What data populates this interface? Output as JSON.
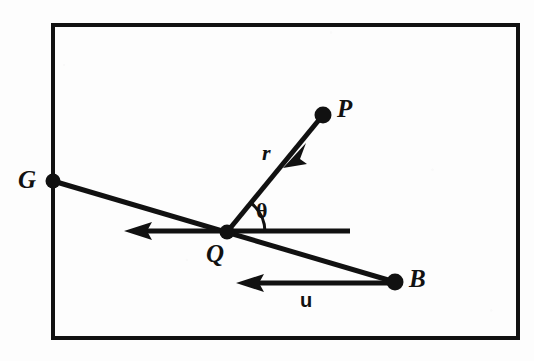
{
  "figure": {
    "kind": "geometry-vector-diagram",
    "background_color": "#fdfdfd",
    "ink_color": "#111111",
    "frame": {
      "x": 53,
      "y": 25,
      "width": 465,
      "height": 313,
      "stroke_width": 4
    },
    "points": [
      {
        "id": "G",
        "label": "G",
        "x": 53,
        "y": 181,
        "label_x": 18,
        "label_y": 167,
        "dot_r": 7
      },
      {
        "id": "Q",
        "label": "Q",
        "x": 227,
        "y": 232,
        "label_x": 206,
        "label_y": 241,
        "dot_r": 7
      },
      {
        "id": "P",
        "label": "P",
        "x": 323,
        "y": 115,
        "label_x": 337,
        "label_y": 96,
        "dot_r": 8
      },
      {
        "id": "B",
        "label": "B",
        "x": 395,
        "y": 282,
        "label_x": 409,
        "label_y": 266,
        "dot_r": 8
      }
    ],
    "segments": [
      {
        "id": "line-G-B",
        "from": "G",
        "to": "B",
        "x1": 53,
        "y1": 181,
        "x2": 395,
        "y2": 282,
        "stroke_width": 5,
        "arrow": "none"
      },
      {
        "id": "line-r-P-to-Q",
        "from": "P",
        "to": "Q",
        "x1": 323,
        "y1": 115,
        "x2": 227,
        "y2": 232,
        "stroke_width": 5,
        "arrow": "mid-toward-Q"
      },
      {
        "id": "ray-horizontal",
        "from": "x=350",
        "to": "x=130",
        "x1": 350,
        "y1": 231,
        "x2": 130,
        "y2": 231,
        "stroke_width": 5,
        "arrow": "end"
      },
      {
        "id": "vector-u",
        "from": "B",
        "to": "x=240",
        "x1": 397,
        "y1": 283,
        "x2": 240,
        "y2": 283,
        "stroke_width": 5,
        "arrow": "end"
      }
    ],
    "angle_arc": {
      "id": "theta-arc",
      "vertex": "Q",
      "cx": 227,
      "cy": 232,
      "radius": 38,
      "from_deg": 0,
      "to_deg": 50,
      "stroke_width": 3
    },
    "labels": {
      "G": "G",
      "Q": "Q",
      "P": "P",
      "B": "B",
      "r": "r",
      "theta": "θ",
      "u": "u"
    },
    "annotations": [
      {
        "id": "r-label",
        "text": "r",
        "x": 262,
        "y": 142,
        "style": "italic-serif"
      },
      {
        "id": "theta-label",
        "text": "θ",
        "x": 256,
        "y": 200,
        "style": "bold-serif"
      },
      {
        "id": "u-label",
        "text": "u",
        "x": 300,
        "y": 290,
        "style": "bold-sans"
      }
    ]
  }
}
